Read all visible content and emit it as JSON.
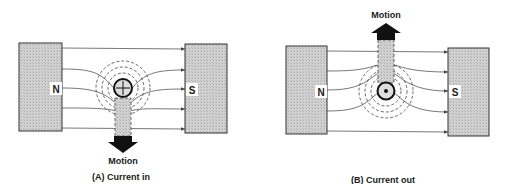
{
  "diagram_a": {
    "north_label": "N",
    "south_label": "S",
    "motion_label": "Motion",
    "caption": "(A) Current in",
    "current_symbol": "cross"
  },
  "diagram_b": {
    "north_label": "N",
    "south_label": "S",
    "motion_label": "Motion",
    "caption": "(B) Current out",
    "current_symbol": "dot"
  },
  "colors": {
    "magnet_fill": "#c9c9c9",
    "line": "#333333",
    "arrow": "#111111",
    "stem_fill": "#bdbdbd"
  }
}
